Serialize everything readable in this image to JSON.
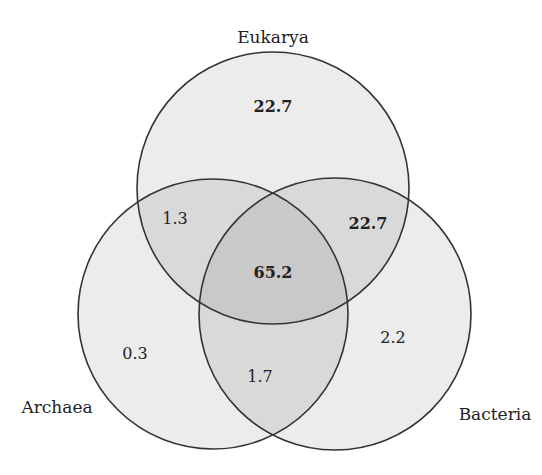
{
  "diagram": {
    "type": "venn-3",
    "colors": {
      "stroke": "#333333",
      "single": "#ececec",
      "double": "#d9d9d9",
      "triple": "#c9c9c9",
      "text": "#222222"
    },
    "sets": [
      {
        "id": "eukarya",
        "label": "Eukarya",
        "cx": 273,
        "cy": 188,
        "r": 136,
        "label_x": 273,
        "label_y": 43
      },
      {
        "id": "archaea",
        "label": "Archaea",
        "cx": 213,
        "cy": 314,
        "r": 135,
        "label_x": 57,
        "label_y": 413
      },
      {
        "id": "bacteria",
        "label": "Bacteria",
        "cx": 335,
        "cy": 314,
        "r": 136,
        "label_x": 495,
        "label_y": 420
      }
    ],
    "regions": [
      {
        "id": "eukarya-only",
        "sets": [
          "Eukarya"
        ],
        "value": "22.7",
        "bold": true,
        "x": 273,
        "y": 112
      },
      {
        "id": "eukarya-archaea",
        "sets": [
          "Eukarya",
          "Archaea"
        ],
        "value": "1.3",
        "bold": false,
        "x": 175,
        "y": 224
      },
      {
        "id": "eukarya-bacteria",
        "sets": [
          "Eukarya",
          "Bacteria"
        ],
        "value": "22.7",
        "bold": true,
        "x": 368,
        "y": 229
      },
      {
        "id": "all-three",
        "sets": [
          "Eukarya",
          "Archaea",
          "Bacteria"
        ],
        "value": "65.2",
        "bold": true,
        "x": 273,
        "y": 278
      },
      {
        "id": "archaea-only",
        "sets": [
          "Archaea"
        ],
        "value": "0.3",
        "bold": false,
        "x": 135,
        "y": 359
      },
      {
        "id": "bacteria-only",
        "sets": [
          "Bacteria"
        ],
        "value": "2.2",
        "bold": false,
        "x": 393,
        "y": 343
      },
      {
        "id": "archaea-bacteria",
        "sets": [
          "Archaea",
          "Bacteria"
        ],
        "value": "1.7",
        "bold": false,
        "x": 260,
        "y": 382
      }
    ]
  }
}
